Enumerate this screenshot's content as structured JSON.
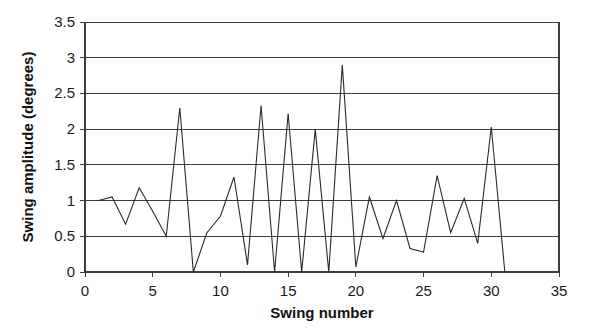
{
  "chart_data": {
    "type": "line",
    "title": "",
    "xlabel": "Swing number",
    "ylabel": "Swing amplitude (degrees)",
    "xlim": [
      0,
      35
    ],
    "ylim": [
      0,
      3.5
    ],
    "xticks": [
      0,
      5,
      10,
      15,
      20,
      25,
      30,
      35
    ],
    "xtick_labels": [
      "0",
      "5",
      "10",
      "15",
      "20",
      "25",
      "30",
      "35"
    ],
    "yticks": [
      0,
      0.5,
      1,
      1.5,
      2,
      2.5,
      3,
      3.5
    ],
    "ytick_labels": [
      "0",
      "0.5",
      "1",
      "1.5",
      "2",
      "2.5",
      "3",
      "3.5"
    ],
    "grid": "horizontal",
    "legend": "none",
    "series": [
      {
        "name": "Swing amplitude",
        "color": "#2b2b2b",
        "x": [
          1,
          2,
          3,
          4,
          5,
          6,
          7,
          8,
          9,
          10,
          11,
          12,
          13,
          14,
          15,
          16,
          17,
          18,
          19,
          20,
          21,
          22,
          23,
          24,
          25,
          26,
          27,
          28,
          29,
          30,
          31
        ],
        "values": [
          1.0,
          1.05,
          0.67,
          1.18,
          0.85,
          0.5,
          2.3,
          0.0,
          0.55,
          0.78,
          1.33,
          0.1,
          2.33,
          0.0,
          2.22,
          0.0,
          2.0,
          0.0,
          2.9,
          0.07,
          1.05,
          0.47,
          1.0,
          0.33,
          0.28,
          1.35,
          0.55,
          1.03,
          0.4,
          2.03,
          0.0
        ]
      }
    ]
  },
  "axes": {
    "x_title": "Swing number",
    "y_title": "Swing amplitude (degrees)"
  }
}
